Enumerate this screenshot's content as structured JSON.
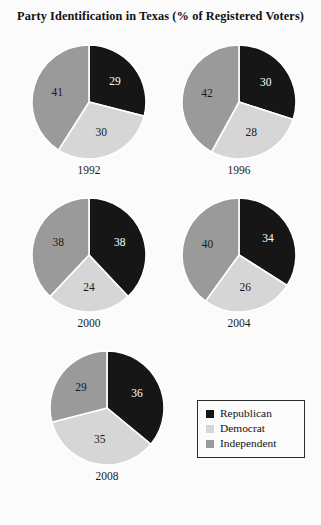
{
  "chart_data": {
    "type": "pie",
    "title": "Party Identification in Texas (% of Registered Voters)",
    "unit": "%",
    "categories": [
      "Republican",
      "Democrat",
      "Independent"
    ],
    "colors": {
      "republican": "#161616",
      "democrat": "#d6d6d6",
      "independent": "#9a9a9a"
    },
    "legend_position": "bottom-right",
    "grid": false,
    "panels": [
      {
        "year": "1992",
        "values": [
          29,
          30,
          41
        ],
        "labels": {
          "republican": "29",
          "democrat": "30",
          "independent": "41"
        }
      },
      {
        "year": "1996",
        "values": [
          30,
          28,
          42
        ],
        "labels": {
          "republican": "30",
          "democrat": "28",
          "independent": "42"
        }
      },
      {
        "year": "2000",
        "values": [
          38,
          24,
          38
        ],
        "labels": {
          "republican": "38",
          "democrat": "24",
          "independent": "38"
        }
      },
      {
        "year": "2004",
        "values": [
          34,
          26,
          40
        ],
        "labels": {
          "republican": "34",
          "democrat": "26",
          "independent": "40"
        }
      },
      {
        "year": "2008",
        "values": [
          36,
          35,
          29
        ],
        "labels": {
          "republican": "36",
          "democrat": "35",
          "independent": "29"
        }
      }
    ],
    "legend": [
      {
        "label": "Republican",
        "color": "#161616"
      },
      {
        "label": "Democrat",
        "color": "#d6d6d6"
      },
      {
        "label": "Independent",
        "color": "#9a9a9a"
      }
    ]
  }
}
